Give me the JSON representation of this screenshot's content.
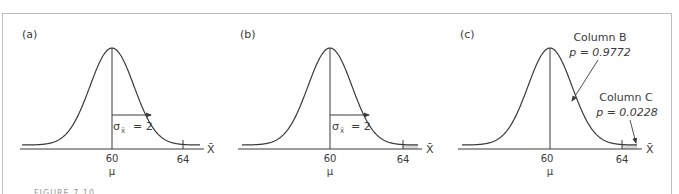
{
  "figure": {
    "caption_cut": "FIGURE 7.10",
    "border_color": "#bdbdbd",
    "line_color": "#3a3a3a",
    "shade_color": "#d9d9d9"
  },
  "panels": [
    {
      "label": "(a)",
      "mean_label": "60",
      "mu_label": "μ",
      "tick_label": "64",
      "axis_label": "X̄",
      "sigma_label": "σ",
      "sigma_sub": "X̄",
      "sigma_value": "= 2",
      "shade_tail": false
    },
    {
      "label": "(b)",
      "mean_label": "60",
      "mu_label": "μ",
      "tick_label": "64",
      "axis_label": "X̄",
      "sigma_label": "σ",
      "sigma_sub": "X̄",
      "sigma_value": "= 2",
      "shade_tail": true
    },
    {
      "label": "(c)",
      "mean_label": "60",
      "mu_label": "μ",
      "tick_label": "64",
      "axis_label": "X̄",
      "shade_tail": true,
      "annotation_b_title": "Column B",
      "annotation_b_value": "p = 0.9772",
      "annotation_c_title": "Column C",
      "annotation_c_value": "p = 0.0228"
    }
  ],
  "chart_data": [
    {
      "type": "line",
      "title": "(a)",
      "description": "Normal distribution of sample means",
      "mean": 60,
      "std_error": 2,
      "xlabel": "X̄",
      "tick_labels": [
        "60",
        "64"
      ],
      "annotations": [
        "σX̄ = 2",
        "μ"
      ]
    },
    {
      "type": "area",
      "title": "(b)",
      "description": "Normal distribution with shaded tail beyond X̄ = 64",
      "mean": 60,
      "std_error": 2,
      "shaded_region": [
        64,
        null
      ],
      "xlabel": "X̄",
      "tick_labels": [
        "60",
        "64"
      ],
      "annotations": [
        "σX̄ = 2",
        "μ"
      ]
    },
    {
      "type": "area",
      "title": "(c)",
      "description": "Proportions from unit normal table",
      "mean": 60,
      "std_error": 2,
      "shaded_region": [
        64,
        null
      ],
      "xlabel": "X̄",
      "tick_labels": [
        "60",
        "64"
      ],
      "annotations": [
        {
          "label": "Column B",
          "p": 0.9772
        },
        {
          "label": "Column C",
          "p": 0.0228
        }
      ]
    }
  ]
}
